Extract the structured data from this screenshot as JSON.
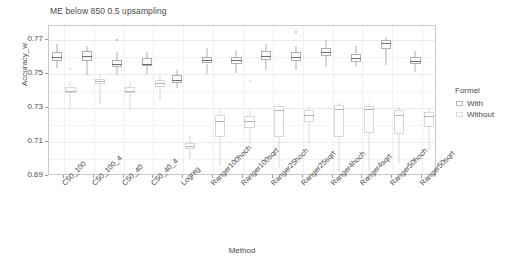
{
  "chart_data": {
    "type": "bar",
    "plot_kind": "grouped-boxplot",
    "title": "ME below 850 0.5 upsampling",
    "xlabel": "Method",
    "ylabel": "Accuracy_w",
    "ylim": [
      0.69,
      0.778
    ],
    "yticks": [
      0.69,
      0.71,
      0.73,
      0.75,
      0.77
    ],
    "ytick_labels": [
      "0.69",
      "0.71",
      "0.73",
      "0.75",
      "0.77"
    ],
    "grid": true,
    "legend": {
      "title": "Formel",
      "position": "right",
      "entries": [
        "With",
        "Without"
      ]
    },
    "categories": [
      "C50_100",
      "C50_100_4",
      "C50_40",
      "C50_40_4",
      "Logreg",
      "Ranger100hoch",
      "Ranger100sqrt",
      "Ranger25hoch",
      "Ranger25sqrt",
      "Ranger4hoch",
      "Ranger4sqrt",
      "Ranger50hoch",
      "Ranger50sqrt"
    ],
    "xtick_labels": [
      "C50_100",
      "C50_100_4",
      "C50_40",
      "C50_40_4",
      "Logreg",
      "Ranger100hoch",
      "Ranger100sqrt",
      "Ranger25hoch",
      "Ranger25sqrt",
      "Ranger4hoch",
      "Ranger4sqrt",
      "Ranger50hoch",
      "Ranger50sqrt"
    ],
    "series": [
      {
        "name": "With",
        "boxes": [
          {
            "category": "C50_100",
            "lower_whisker": 0.7535,
            "q1": 0.7575,
            "median": 0.76,
            "q3": 0.7625,
            "upper_whisker": 0.7675,
            "outliers": []
          },
          {
            "category": "C50_100_4",
            "lower_whisker": 0.749,
            "q1": 0.7575,
            "median": 0.7605,
            "q3": 0.7635,
            "upper_whisker": 0.766,
            "outliers": []
          },
          {
            "category": "C50_40",
            "lower_whisker": 0.749,
            "q1": 0.754,
            "median": 0.756,
            "q3": 0.758,
            "upper_whisker": 0.7625,
            "outliers": [
              0.77
            ]
          },
          {
            "category": "C50_40_4",
            "lower_whisker": 0.75,
            "q1": 0.7545,
            "median": 0.756,
            "q3": 0.759,
            "upper_whisker": 0.7625,
            "outliers": []
          },
          {
            "category": "Logreg",
            "lower_whisker": 0.7415,
            "q1": 0.7445,
            "median": 0.7465,
            "q3": 0.749,
            "upper_whisker": 0.752,
            "outliers": []
          },
          {
            "category": "Ranger100hoch",
            "lower_whisker": 0.75,
            "q1": 0.756,
            "median": 0.758,
            "q3": 0.76,
            "upper_whisker": 0.765,
            "outliers": []
          },
          {
            "category": "Ranger100sqrt",
            "lower_whisker": 0.7505,
            "q1": 0.7555,
            "median": 0.758,
            "q3": 0.76,
            "upper_whisker": 0.764,
            "outliers": []
          },
          {
            "category": "Ranger25hoch",
            "lower_whisker": 0.752,
            "q1": 0.758,
            "median": 0.7605,
            "q3": 0.7635,
            "upper_whisker": 0.7675,
            "outliers": []
          },
          {
            "category": "Ranger25sqrt",
            "lower_whisker": 0.752,
            "q1": 0.7575,
            "median": 0.76,
            "q3": 0.7625,
            "upper_whisker": 0.7665,
            "outliers": [
              0.7745
            ]
          },
          {
            "category": "Ranger4hoch",
            "lower_whisker": 0.754,
            "q1": 0.7605,
            "median": 0.7625,
            "q3": 0.765,
            "upper_whisker": 0.7695,
            "outliers": []
          },
          {
            "category": "Ranger4sqrt",
            "lower_whisker": 0.7545,
            "q1": 0.757,
            "median": 0.7595,
            "q3": 0.7615,
            "upper_whisker": 0.766,
            "outliers": []
          },
          {
            "category": "Ranger50hoch",
            "lower_whisker": 0.755,
            "q1": 0.7645,
            "median": 0.768,
            "q3": 0.77,
            "upper_whisker": 0.7715,
            "outliers": []
          },
          {
            "category": "Ranger50sqrt",
            "lower_whisker": 0.751,
            "q1": 0.7555,
            "median": 0.7575,
            "q3": 0.76,
            "upper_whisker": 0.7635,
            "outliers": []
          }
        ]
      },
      {
        "name": "Without",
        "boxes": [
          {
            "category": "C50_100",
            "lower_whisker": 0.729,
            "q1": 0.7385,
            "median": 0.74,
            "q3": 0.7425,
            "upper_whisker": 0.746,
            "outliers": [
              0.7525
            ]
          },
          {
            "category": "C50_100_4",
            "lower_whisker": 0.732,
            "q1": 0.744,
            "median": 0.7455,
            "q3": 0.747,
            "upper_whisker": 0.75,
            "outliers": [
              0.7355
            ]
          },
          {
            "category": "C50_40",
            "lower_whisker": 0.729,
            "q1": 0.7385,
            "median": 0.74,
            "q3": 0.742,
            "upper_whisker": 0.7455,
            "outliers": []
          },
          {
            "category": "C50_40_4",
            "lower_whisker": 0.734,
            "q1": 0.7425,
            "median": 0.7445,
            "q3": 0.7465,
            "upper_whisker": 0.75,
            "outliers": []
          },
          {
            "category": "Logreg",
            "lower_whisker": 0.7,
            "q1": 0.706,
            "median": 0.7075,
            "q3": 0.7095,
            "upper_whisker": 0.7135,
            "outliers": []
          },
          {
            "category": "Ranger100hoch",
            "lower_whisker": 0.696,
            "q1": 0.713,
            "median": 0.7225,
            "q3": 0.7255,
            "upper_whisker": 0.73,
            "outliers": []
          },
          {
            "category": "Ranger100sqrt",
            "lower_whisker": 0.709,
            "q1": 0.718,
            "median": 0.722,
            "q3": 0.725,
            "upper_whisker": 0.729,
            "outliers": [
              0.746
            ]
          },
          {
            "category": "Ranger25hoch",
            "lower_whisker": 0.695,
            "q1": 0.713,
            "median": 0.729,
            "q3": 0.731,
            "upper_whisker": 0.733,
            "outliers": []
          },
          {
            "category": "Ranger25sqrt",
            "lower_whisker": 0.7095,
            "q1": 0.7215,
            "median": 0.7255,
            "q3": 0.7285,
            "upper_whisker": 0.731,
            "outliers": []
          },
          {
            "category": "Ranger4hoch",
            "lower_whisker": 0.6925,
            "q1": 0.713,
            "median": 0.7295,
            "q3": 0.7315,
            "upper_whisker": 0.733,
            "outliers": []
          },
          {
            "category": "Ranger4sqrt",
            "lower_whisker": 0.693,
            "q1": 0.7155,
            "median": 0.7295,
            "q3": 0.731,
            "upper_whisker": 0.733,
            "outliers": []
          },
          {
            "category": "Ranger50hoch",
            "lower_whisker": 0.6975,
            "q1": 0.7145,
            "median": 0.726,
            "q3": 0.729,
            "upper_whisker": 0.7305,
            "outliers": []
          },
          {
            "category": "Ranger50sqrt",
            "lower_whisker": 0.705,
            "q1": 0.719,
            "median": 0.725,
            "q3": 0.7275,
            "upper_whisker": 0.73,
            "outliers": []
          }
        ]
      }
    ]
  },
  "colors": {
    "panel_border": "#c9c9c9",
    "grid_major": "#ebebeb",
    "grid_minor": "#f4f4f4",
    "box_stroke_with": "#b0b0b0",
    "box_stroke_without": "#d8d8d8",
    "median": "#6e6e6e",
    "text": "#4a4a4a",
    "background": "#ffffff"
  }
}
